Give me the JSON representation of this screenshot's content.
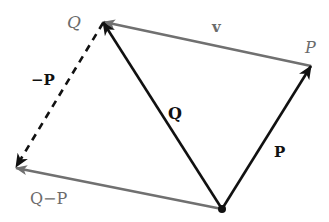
{
  "diagram": {
    "type": "vector-diagram",
    "colors": {
      "black_vector": "#111111",
      "grey_vector": "#707070",
      "background": "#ffffff"
    },
    "points": {
      "origin": {
        "x": 222,
        "y": 209
      },
      "Q": {
        "x": 103,
        "y": 22
      },
      "P": {
        "x": 311,
        "y": 66
      },
      "Q_minus_P": {
        "x": 15,
        "y": 168
      }
    },
    "labels": {
      "point_Q": "Q",
      "point_P": "P",
      "vector_v": "v",
      "vector_neg_P": "−P",
      "vector_Q": "Q",
      "vector_P": "P",
      "vector_Q_minus_P": "Q−P"
    },
    "vectors": [
      {
        "name": "Q",
        "from": "origin",
        "to": "Q",
        "color": "black",
        "style": "solid"
      },
      {
        "name": "P",
        "from": "origin",
        "to": "P",
        "color": "black",
        "style": "solid"
      },
      {
        "name": "v",
        "from": "P",
        "to": "Q",
        "color": "grey",
        "style": "solid"
      },
      {
        "name": "-P",
        "from": "Q",
        "to": "Q_minus_P",
        "color": "black",
        "style": "dashed"
      },
      {
        "name": "Q-P",
        "from": "origin",
        "to": "Q_minus_P",
        "color": "grey",
        "style": "solid"
      }
    ]
  }
}
